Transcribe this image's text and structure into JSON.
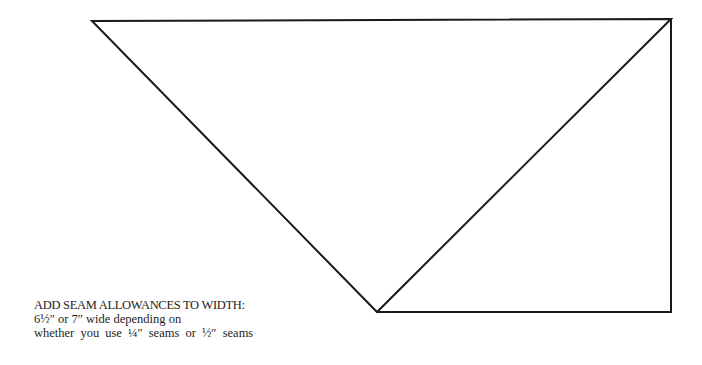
{
  "diagram": {
    "type": "quilt-pattern-template",
    "shapes": [
      {
        "name": "large-triangle",
        "points": [
          [
            92,
            21
          ],
          [
            671,
            19
          ],
          [
            377,
            312
          ]
        ]
      },
      {
        "name": "right-triangle",
        "points": [
          [
            377,
            312
          ],
          [
            671,
            19
          ],
          [
            671,
            312
          ]
        ]
      }
    ],
    "stroke_color": "#1a1a1a"
  },
  "caption": {
    "line1": "ADD SEAM ALLOWANCES TO WIDTH:",
    "line2": "6½″ or 7″ wide depending on",
    "line3": "whether you use ¼″ seams or ½″ seams"
  }
}
